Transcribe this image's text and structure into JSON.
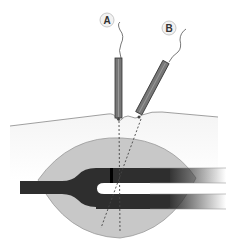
{
  "diagram": {
    "labels": {
      "probe_a": "A",
      "probe_b": "B"
    },
    "colors": {
      "background": "#ffffff",
      "skin_layer": "#fafafa",
      "skin_line": "#888888",
      "lens_fill": "#c8c8c8",
      "lens_outline": "#999999",
      "tube_dark": "#2e2e2e",
      "probe_fill": "#777777",
      "probe_outline": "#333333",
      "dashed_line": "#444444",
      "label_circle": "#f2f2f2"
    }
  }
}
